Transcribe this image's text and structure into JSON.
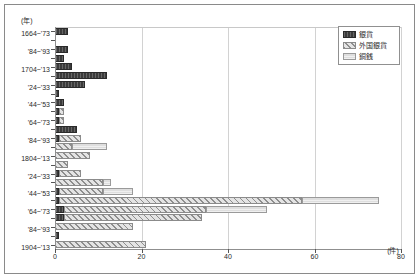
{
  "chart_data": {
    "type": "bar",
    "orientation": "horizontal",
    "stacked": true,
    "title": "",
    "xlabel": "(件)",
    "ylabel": "(年)",
    "xlim": [
      0,
      80
    ],
    "xticks": [
      "0",
      "20",
      "40",
      "60",
      "80"
    ],
    "xtick_values": [
      0,
      20,
      40,
      60,
      80
    ],
    "grid": "vertical",
    "legend_position": "top-right",
    "legend": [
      {
        "name": "銀貨",
        "color": "#3b3b3b",
        "pattern": "solid-dark"
      },
      {
        "name": "外国銀貨",
        "color": "#dcdcdc",
        "pattern": "diagonal-hatch"
      },
      {
        "name": "銅銭",
        "color": "#dedede",
        "pattern": "light-horizontal"
      }
    ],
    "categories": [
      "1664~'73",
      "'74~'83",
      "'84~'93",
      "'94~1703",
      "1704~'13",
      "'14~'23",
      "'24~'33",
      "'34~'43",
      "'44~'53",
      "'54~'63",
      "'64~'73",
      "'74~'83",
      "'84~'93",
      "'94~1803",
      "1804~'13",
      "'14~'23",
      "'24~'33",
      "'34~'43",
      "'44~'53",
      "'54~'63",
      "'64~'73",
      "'74~'83",
      "'84~'93",
      "'94~1903",
      "1904~'13"
    ],
    "axis_labels_shown": [
      "1664~'73",
      "'84~'93",
      "1704~'13",
      "'24~'33",
      "'44~'53",
      "'64~'73",
      "'84~'93",
      "1804~'13",
      "'24~'33",
      "'44~'53",
      "'64~'73",
      "'84~'93",
      "1904~'13"
    ],
    "series": [
      {
        "name": "銀貨",
        "values": [
          3,
          0,
          3,
          2,
          4,
          12,
          7,
          1,
          2,
          1,
          1,
          5,
          1,
          0,
          0,
          0,
          1,
          0,
          1,
          1,
          2,
          2,
          0,
          1,
          0
        ]
      },
      {
        "name": "外国銀貨",
        "values": [
          0,
          0,
          0,
          0,
          0,
          0,
          0,
          0,
          0,
          1,
          1,
          0,
          5,
          4,
          8,
          3,
          5,
          11,
          10,
          56,
          33,
          32,
          18,
          0,
          21
        ]
      },
      {
        "name": "銅銭",
        "values": [
          0,
          0,
          0,
          0,
          0,
          0,
          0,
          0,
          0,
          0,
          0,
          0,
          0,
          8,
          0,
          0,
          0,
          2,
          7,
          18,
          14,
          0,
          0,
          0,
          0
        ]
      }
    ],
    "totals": [
      3,
      0,
      3,
      2,
      4,
      12,
      7,
      1,
      2,
      2,
      2,
      5,
      6,
      12,
      8,
      3,
      6,
      13,
      18,
      74,
      47,
      34,
      18,
      1,
      21
    ]
  }
}
